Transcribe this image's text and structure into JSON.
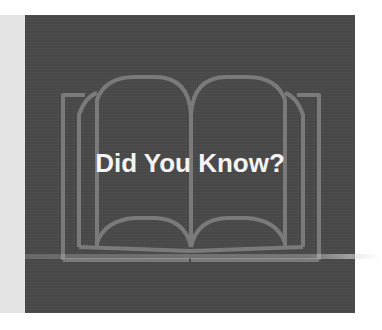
{
  "slide": {
    "title": "Did You Know?",
    "icon": "open-book-icon",
    "colors": {
      "background": "#ffffff",
      "side_strip": "#e4e4e4",
      "panel": "#4a4a4a",
      "book_outline": "#7a7a7a",
      "title_text": "#f4f4f4"
    }
  }
}
